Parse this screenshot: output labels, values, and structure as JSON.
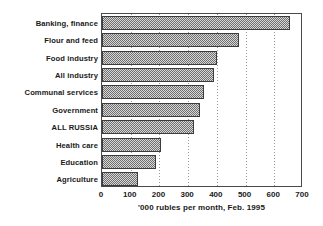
{
  "chart_data": {
    "type": "bar",
    "orientation": "horizontal",
    "title": "",
    "subtitle": "",
    "xlabel": "'000 rubles per month, Feb. 1995",
    "ylabel": "",
    "xlim": [
      0,
      700
    ],
    "xticks": [
      0,
      100,
      200,
      300,
      400,
      500,
      600,
      700
    ],
    "xtick_labels": [
      "0",
      "100",
      "200",
      "300",
      "400",
      "500",
      "600",
      "700"
    ],
    "grid": "vertical-dotted",
    "legend": "none",
    "categories": [
      "Banking, finance",
      "Flour and feed",
      "Food industry",
      "All industry",
      "Communal services",
      "Government",
      "ALL RUSSIA",
      "Health care",
      "Education",
      "Agriculture"
    ],
    "values": [
      655,
      476,
      402,
      389,
      354,
      343,
      322,
      207,
      189,
      126
    ],
    "series": [
      {
        "name": "Average wage",
        "values": [
          655,
          476,
          402,
          389,
          354,
          343,
          322,
          207,
          189,
          126
        ]
      }
    ],
    "colors": {
      "bar_fill": "#cfcfcf",
      "bar_pattern": "#6f6f6f",
      "bar_border": "#3c3c3c",
      "axis": "#4a4a4a",
      "gridline": "#9a9a9a",
      "text": "#1a1a1a",
      "background": "#ffffff"
    }
  }
}
